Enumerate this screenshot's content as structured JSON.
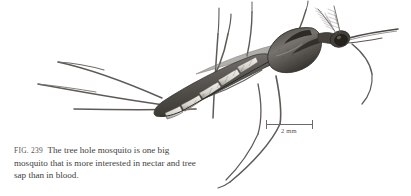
{
  "figure": {
    "number_label": "FIG. 239",
    "caption_text": "The tree hole mosquito is one big mosquito that is more interested in nectar and tree sap than in blood.",
    "subject": "tree hole mosquito",
    "illustration_style": "stippled pen-and-ink scientific engraving, grayscale",
    "background_color": "#ffffff",
    "ink_color": "#5a5754"
  },
  "scale_bar": {
    "label": "2 mm",
    "value": 2,
    "unit": "mm",
    "color": "#6d6a66"
  }
}
